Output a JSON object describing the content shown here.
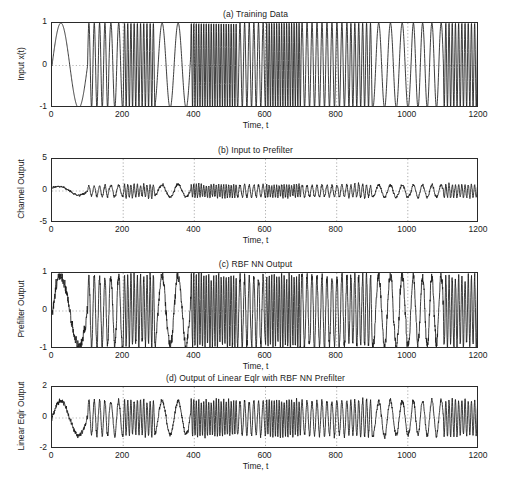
{
  "figure": {
    "background": "#ffffff",
    "trace_color": "#1b1b1b",
    "axis_color": "#2a2a2a",
    "grid_color": "#8a8a8a",
    "shared_xlabel": "Time, t"
  },
  "panels": [
    {
      "id": "a",
      "title": "(a) Training Data",
      "ylabel": "Input x(t)",
      "xlabel": "Time, t",
      "yticks": [
        "1",
        "0",
        "-1"
      ],
      "xticks": [
        "0",
        "200",
        "400",
        "600",
        "800",
        "1000",
        "1200"
      ]
    },
    {
      "id": "b",
      "title": "(b) Input to Prefilter",
      "ylabel": "Channel  Output",
      "xlabel": "Time, t",
      "yticks": [
        "5",
        "0",
        "-5"
      ],
      "xticks": [
        "0",
        "200",
        "400",
        "600",
        "800",
        "1000",
        "1200"
      ]
    },
    {
      "id": "c",
      "title": "(c) RBF NN Output",
      "ylabel": "Prefilter Output",
      "xlabel": "Time, t",
      "yticks": [
        "1",
        "0",
        "-1"
      ],
      "xticks": [
        "0",
        "200",
        "400",
        "600",
        "800",
        "1000",
        "1200"
      ]
    },
    {
      "id": "d",
      "title": "(d) Output of Linear Eqlr with RBF NN Prefilter",
      "ylabel": "Linear Eqlr Output",
      "xlabel": "Time, t",
      "yticks": [
        "2",
        "0",
        "-2"
      ],
      "xticks": [
        "0",
        "200",
        "400",
        "600",
        "800",
        "1000",
        "1200"
      ]
    }
  ],
  "chart_data": [
    {
      "type": "line",
      "panel": "a",
      "title": "(a) Training Data",
      "xlabel": "Time, t",
      "ylabel": "Input x(t)",
      "xlim": [
        0,
        1200
      ],
      "ylim": [
        -1,
        1
      ],
      "xticks": [
        0,
        200,
        400,
        600,
        800,
        1000,
        1200
      ],
      "yticks": [
        -1,
        0,
        1
      ],
      "grid": true,
      "legend": null,
      "description": "Piecewise-constant-frequency sinusoid, amplitude 1, frequency switching in blocks between slow and fast segments",
      "signal_model": {
        "kind": "piecewise_sinusoid",
        "amplitude": 1.0,
        "noise_std": 0.0,
        "segments": [
          {
            "t_start": 0,
            "t_end": 100,
            "period": 100
          },
          {
            "t_start": 100,
            "t_end": 160,
            "period": 15
          },
          {
            "t_start": 160,
            "t_end": 200,
            "period": 22
          },
          {
            "t_start": 200,
            "t_end": 290,
            "period": 9
          },
          {
            "t_start": 290,
            "t_end": 390,
            "period": 45
          },
          {
            "t_start": 390,
            "t_end": 520,
            "period": 7
          },
          {
            "t_start": 520,
            "t_end": 600,
            "period": 13
          },
          {
            "t_start": 600,
            "t_end": 700,
            "period": 7
          },
          {
            "t_start": 700,
            "t_end": 830,
            "period": 14
          },
          {
            "t_start": 830,
            "t_end": 900,
            "period": 11
          },
          {
            "t_start": 900,
            "t_end": 1010,
            "period": 33
          },
          {
            "t_start": 1010,
            "t_end": 1100,
            "period": 26
          },
          {
            "t_start": 1100,
            "t_end": 1200,
            "period": 9
          }
        ]
      }
    },
    {
      "type": "line",
      "panel": "b",
      "title": "(b) Input to Prefilter",
      "xlabel": "Time, t",
      "ylabel": "Channel  Output",
      "xlim": [
        0,
        1200
      ],
      "ylim": [
        -5,
        5
      ],
      "xticks": [
        0,
        200,
        400,
        600,
        800,
        1000,
        1200
      ],
      "yticks": [
        -5,
        0,
        5
      ],
      "grid": true,
      "legend": null,
      "description": "Channel-distorted noisy version of training data; envelope roughly within plus/minus 2, centred near 0",
      "signal_model": {
        "kind": "piecewise_sinusoid_noisy",
        "amplitude": 0.95,
        "noise_std": 0.28,
        "envelope_decay": true,
        "segments": [
          {
            "t_start": 0,
            "t_end": 100,
            "period": 100
          },
          {
            "t_start": 100,
            "t_end": 160,
            "period": 15
          },
          {
            "t_start": 160,
            "t_end": 200,
            "period": 22
          },
          {
            "t_start": 200,
            "t_end": 290,
            "period": 9
          },
          {
            "t_start": 290,
            "t_end": 390,
            "period": 45
          },
          {
            "t_start": 390,
            "t_end": 520,
            "period": 7
          },
          {
            "t_start": 520,
            "t_end": 600,
            "period": 13
          },
          {
            "t_start": 600,
            "t_end": 700,
            "period": 7
          },
          {
            "t_start": 700,
            "t_end": 830,
            "period": 14
          },
          {
            "t_start": 830,
            "t_end": 900,
            "period": 11
          },
          {
            "t_start": 900,
            "t_end": 1010,
            "period": 33
          },
          {
            "t_start": 1010,
            "t_end": 1100,
            "period": 26
          },
          {
            "t_start": 1100,
            "t_end": 1200,
            "period": 9
          }
        ]
      }
    },
    {
      "type": "line",
      "panel": "c",
      "title": "(c) RBF NN Output",
      "xlabel": "Time, t",
      "ylabel": "Prefilter Output",
      "xlim": [
        0,
        1200
      ],
      "ylim": [
        -1,
        1
      ],
      "xticks": [
        0,
        200,
        400,
        600,
        800,
        1000,
        1200
      ],
      "yticks": [
        -1,
        0,
        1
      ],
      "grid": true,
      "legend": null,
      "description": "RBF neural network prefilter output; recovers block frequency structure, clipped near plus/minus 1 with noise",
      "signal_model": {
        "kind": "piecewise_sinusoid_noisy",
        "amplitude": 0.92,
        "noise_std": 0.17,
        "clip": 1.0,
        "segments": [
          {
            "t_start": 0,
            "t_end": 100,
            "period": 100
          },
          {
            "t_start": 100,
            "t_end": 160,
            "period": 15
          },
          {
            "t_start": 160,
            "t_end": 200,
            "period": 22
          },
          {
            "t_start": 200,
            "t_end": 290,
            "period": 9
          },
          {
            "t_start": 290,
            "t_end": 390,
            "period": 45
          },
          {
            "t_start": 390,
            "t_end": 520,
            "period": 7
          },
          {
            "t_start": 520,
            "t_end": 600,
            "period": 13
          },
          {
            "t_start": 600,
            "t_end": 700,
            "period": 7
          },
          {
            "t_start": 700,
            "t_end": 830,
            "period": 14
          },
          {
            "t_start": 830,
            "t_end": 900,
            "period": 11
          },
          {
            "t_start": 900,
            "t_end": 1010,
            "period": 33
          },
          {
            "t_start": 1010,
            "t_end": 1100,
            "period": 26
          },
          {
            "t_start": 1100,
            "t_end": 1200,
            "period": 9
          }
        ]
      }
    },
    {
      "type": "line",
      "panel": "d",
      "title": "(d) Output of Linear Eqlr with RBF NN Prefilter",
      "xlabel": "Time, t",
      "ylabel": "Linear Eqlr Output",
      "xlim": [
        0,
        1200
      ],
      "ylim": [
        -2,
        2
      ],
      "xticks": [
        0,
        200,
        400,
        600,
        800,
        1000,
        1200
      ],
      "yticks": [
        -2,
        0,
        2
      ],
      "grid": true,
      "legend": null,
      "description": "Linear equalizer output following RBF NN prefilter; block structure preserved, envelope within about plus/minus 1.4",
      "signal_model": {
        "kind": "piecewise_sinusoid_noisy",
        "amplitude": 1.12,
        "noise_std": 0.18,
        "segments": [
          {
            "t_start": 0,
            "t_end": 100,
            "period": 100
          },
          {
            "t_start": 100,
            "t_end": 160,
            "period": 15
          },
          {
            "t_start": 160,
            "t_end": 200,
            "period": 22
          },
          {
            "t_start": 200,
            "t_end": 290,
            "period": 9
          },
          {
            "t_start": 290,
            "t_end": 390,
            "period": 45
          },
          {
            "t_start": 390,
            "t_end": 520,
            "period": 7
          },
          {
            "t_start": 520,
            "t_end": 600,
            "period": 13
          },
          {
            "t_start": 600,
            "t_end": 700,
            "period": 7
          },
          {
            "t_start": 700,
            "t_end": 830,
            "period": 14
          },
          {
            "t_start": 830,
            "t_end": 900,
            "period": 11
          },
          {
            "t_start": 900,
            "t_end": 1010,
            "period": 33
          },
          {
            "t_start": 1010,
            "t_end": 1100,
            "period": 26
          },
          {
            "t_start": 1100,
            "t_end": 1200,
            "period": 9
          }
        ]
      }
    }
  ]
}
